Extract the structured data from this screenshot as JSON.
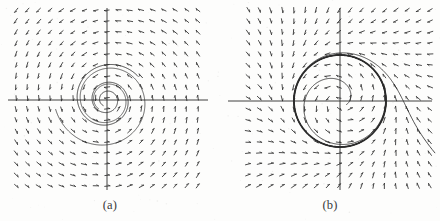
{
  "figure": {
    "background_color": "#fdfdfc",
    "ink_color": "#2a2a2a",
    "panels": [
      {
        "id": "a",
        "caption": "(a)",
        "kind": "stable-spiral",
        "axes": {
          "x_axis_y": 100,
          "y_axis_x": 107,
          "x_from": 8,
          "x_to": 208,
          "y_from": 8,
          "y_to": 190
        },
        "field": {
          "left": 16,
          "top": 10,
          "right": 198,
          "bottom": 186,
          "cols": 17,
          "rows": 17
        },
        "dynamics": {
          "type": "linear",
          "a": -0.11,
          "omega": 1.0,
          "center_x": 107,
          "center_y": 100,
          "scale": 38
        },
        "trajectories": [
          {
            "start_x": 0.82,
            "start_y": 0.62,
            "turns": 2.55,
            "weight": 0.95
          },
          {
            "start_x": -1.35,
            "start_y": -0.25,
            "turns": 2.1,
            "weight": 0.8
          }
        ]
      },
      {
        "id": "b",
        "caption": "(b)",
        "kind": "stable-limit-cycle",
        "axes": {
          "x_axis_y": 101,
          "y_axis_x": 340,
          "x_from": 228,
          "x_to": 432,
          "y_from": 8,
          "y_to": 190
        },
        "field": {
          "left": 248,
          "top": 10,
          "right": 430,
          "bottom": 186,
          "cols": 17,
          "rows": 17
        },
        "dynamics": {
          "type": "limit-cycle",
          "radius": 1.0,
          "mu": 0.55,
          "omega": 1.0,
          "center_x": 340,
          "center_y": 101,
          "scale": 46
        },
        "trajectories": [
          {
            "start_r": 0.16,
            "turns": 3.4,
            "weight": 0.9
          },
          {
            "start_r": 2.35,
            "turns": 2.2,
            "weight": 0.9
          },
          {
            "start_r": 1.0,
            "turns": 2.0,
            "weight": 1.8
          }
        ]
      }
    ]
  },
  "chart_data": {
    "type": "scatter",
    "xlabel": "",
    "ylabel": "",
    "grid": false,
    "legend": "none",
    "subplots": [
      {
        "label": "(a)",
        "description": "Direction field of a linear system with a stable spiral point at the origin; trajectories spiral inward counterclockwise.",
        "equilibrium": {
          "x": 0,
          "y": 0,
          "classification": "stable spiral"
        },
        "xlim": [
          -2.4,
          2.4
        ],
        "ylim": [
          -2.4,
          2.4
        ],
        "damping": -0.11,
        "angular_frequency": 1.0
      },
      {
        "label": "(b)",
        "description": "Direction field of a nonlinear system with an unstable spiral point at the origin surrounded by a stable limit cycle of radius 1; trajectories from inside and outside approach the cycle.",
        "equilibrium": {
          "x": 0,
          "y": 0,
          "classification": "unstable spiral"
        },
        "limit_cycle_radius": 1.0,
        "xlim": [
          -2.0,
          2.0
        ],
        "ylim": [
          -2.0,
          2.0
        ],
        "growth_rate": 0.55,
        "angular_frequency": 1.0
      }
    ]
  }
}
